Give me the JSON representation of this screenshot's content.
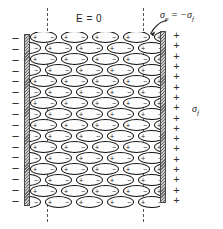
{
  "figure": {
    "type": "physics-diagram"
  },
  "labels": {
    "field_label": "E = 0",
    "bound_charge": {
      "symbol": "σ",
      "sub": "p",
      "relation": " = −",
      "symbol2": "σ",
      "sub2": "f"
    },
    "free_charge": {
      "symbol": "σ",
      "sub": "f"
    }
  },
  "plates": {
    "left": {
      "name": "negative-plate",
      "charge_sign": "−",
      "sign_count": 16
    },
    "right": {
      "name": "positive-plate",
      "charge_sign": "+",
      "sign_count": 17
    }
  },
  "dielectric": {
    "rows": 16,
    "dipoles_per_full_row": 5,
    "dipoles_per_offset_row": 5,
    "dipole_positive_sign": "+",
    "dipole_negative_sign": "−",
    "stagger_offset_px": 16
  },
  "guides": {
    "dashed_lines": 2
  },
  "colors": {
    "ink": "#111111",
    "plate_hatch_dark": "#6e6e6e",
    "plate_hatch_light": "#c9c9c9",
    "background": "#ffffff"
  }
}
